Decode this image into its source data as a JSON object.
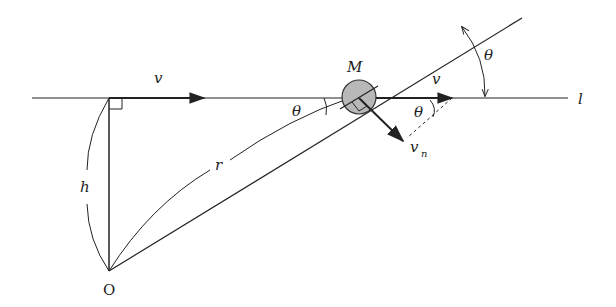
{
  "diagram": {
    "type": "physics-geometry",
    "labels": {
      "line": "l",
      "particle": "M",
      "origin": "O",
      "height": "h",
      "radius": "r",
      "velocity_left": "v",
      "velocity_right": "v",
      "normal_velocity_main": "v",
      "normal_velocity_sub": "n",
      "angle_at_M": "θ",
      "angle_at_v": "θ",
      "angle_outer": "θ"
    },
    "colors": {
      "stroke": "#222222",
      "particle_fill": "#b8b8b8",
      "background": "#ffffff"
    }
  }
}
